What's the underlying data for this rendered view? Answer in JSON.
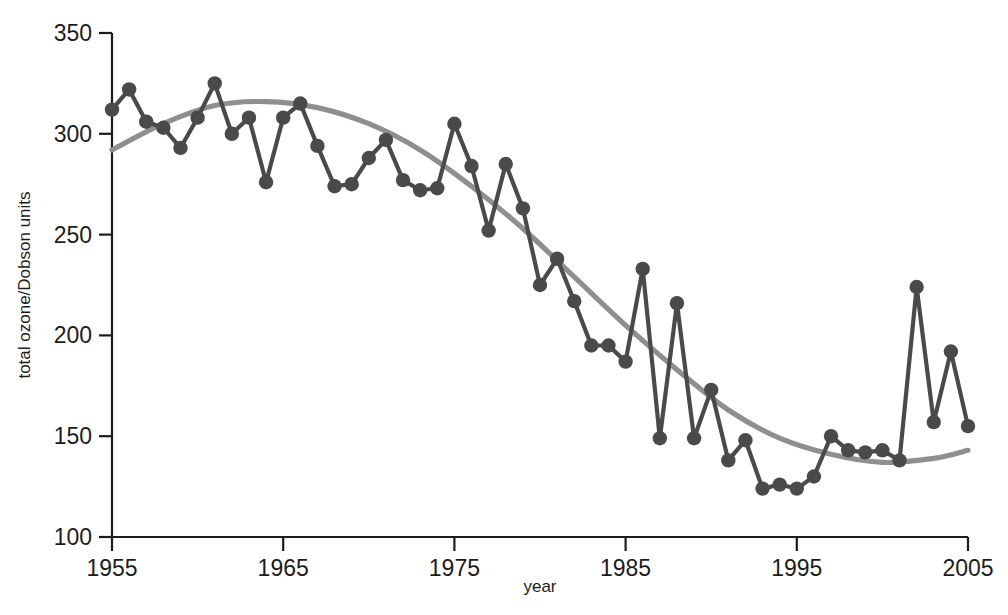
{
  "chart_data": {
    "type": "line",
    "title": "",
    "subtitle": "",
    "xlabel": "year",
    "ylabel": "total ozone/Dobson units",
    "xlim": [
      1955,
      2005
    ],
    "ylim": [
      100,
      350
    ],
    "xticks": [
      1955,
      1965,
      1975,
      1985,
      1995,
      2005
    ],
    "xtick_labels": [
      "1955",
      "1965",
      "1975",
      "1985",
      "1995",
      "2005"
    ],
    "yticks": [
      100,
      150,
      200,
      250,
      300,
      350
    ],
    "ytick_labels": [
      "100",
      "150",
      "200",
      "250",
      "300",
      "350"
    ],
    "grid": false,
    "legend": null,
    "annotations": [],
    "series": [
      {
        "name": "total ozone measurements",
        "marker": "circle",
        "color": "#4a4a4a",
        "x": [
          1955,
          1956,
          1957,
          1958,
          1959,
          1960,
          1961,
          1962,
          1963,
          1964,
          1965,
          1966,
          1967,
          1968,
          1969,
          1970,
          1971,
          1972,
          1973,
          1974,
          1975,
          1976,
          1977,
          1978,
          1979,
          1980,
          1981,
          1982,
          1983,
          1984,
          1985,
          1986,
          1987,
          1988,
          1989,
          1990,
          1991,
          1992,
          1993,
          1994,
          1995,
          1996,
          1997,
          1998,
          1999,
          2000,
          2001,
          2002,
          2003,
          2004
        ],
        "values": [
          312,
          322,
          306,
          303,
          293,
          308,
          325,
          300,
          308,
          276,
          308,
          315,
          294,
          274,
          275,
          288,
          297,
          277,
          272,
          273,
          305,
          284,
          252,
          285,
          263,
          225,
          238,
          217,
          195,
          195,
          187,
          233,
          149,
          216,
          149,
          173,
          138,
          148,
          124,
          126,
          124,
          130,
          150,
          143,
          142,
          143,
          138,
          224,
          157,
          192
        ],
        "last_point": {
          "x": 2005,
          "y": 155
        }
      },
      {
        "name": "fitted trend curve",
        "marker": "none",
        "color": "#8f8f8f",
        "x": [
          1955,
          1958,
          1961,
          1964,
          1967,
          1970,
          1973,
          1976,
          1979,
          1982,
          1985,
          1988,
          1991,
          1994,
          1997,
          2000,
          2003,
          2005
        ],
        "values": [
          292,
          305,
          314,
          316,
          313,
          305,
          292,
          274,
          253,
          229,
          205,
          183,
          163,
          149,
          141,
          137,
          139,
          143
        ]
      }
    ]
  },
  "axis": {
    "x_title": "year",
    "y_title": "total ozone/Dobson units"
  }
}
